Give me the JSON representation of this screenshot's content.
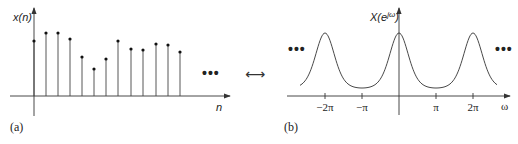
{
  "panel_a": {
    "caption": "(a)",
    "y_label": "x(n)",
    "x_label": "n",
    "ellipsis": "•••",
    "stems": [
      {
        "x": 34,
        "top": 41
      },
      {
        "x": 46,
        "top": 33
      },
      {
        "x": 58,
        "top": 33
      },
      {
        "x": 70,
        "top": 39
      },
      {
        "x": 82,
        "top": 57
      },
      {
        "x": 94,
        "top": 69
      },
      {
        "x": 106,
        "top": 59
      },
      {
        "x": 118,
        "top": 41
      },
      {
        "x": 131,
        "top": 49
      },
      {
        "x": 143,
        "top": 50
      },
      {
        "x": 156,
        "top": 44
      },
      {
        "x": 168,
        "top": 45
      },
      {
        "x": 180,
        "top": 52
      }
    ]
  },
  "transform_arrow": "⟷",
  "panel_b": {
    "caption": "(b)",
    "y_label": "X(e",
    "y_label_sup": "jω",
    "y_label_close": ")",
    "x_label": "ω",
    "ellipsis_left": "•••",
    "ellipsis_right": "•••",
    "ticks": [
      {
        "label": "−2π",
        "x": 325
      },
      {
        "label": "−π",
        "x": 362
      },
      {
        "label": "π",
        "x": 436
      },
      {
        "label": "2π",
        "x": 473
      }
    ]
  }
}
